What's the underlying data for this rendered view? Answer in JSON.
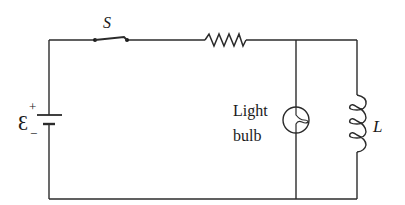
{
  "diagram": {
    "type": "circuit",
    "labels": {
      "switch": "S",
      "emf": "Ɛ",
      "plus": "+",
      "minus": "−",
      "bulb_line1": "Light",
      "bulb_line2": "bulb",
      "inductor": "L"
    },
    "components": [
      {
        "name": "battery",
        "symbol": "emf-source",
        "label": "Ɛ"
      },
      {
        "name": "switch",
        "symbol": "open-switch",
        "label": "S"
      },
      {
        "name": "resistor",
        "symbol": "zigzag",
        "label": ""
      },
      {
        "name": "light-bulb",
        "symbol": "lamp",
        "label": "Light bulb"
      },
      {
        "name": "inductor",
        "symbol": "coil",
        "label": "L"
      }
    ],
    "colors": {
      "wire": "#2b2b2b",
      "background": "#ffffff"
    }
  }
}
